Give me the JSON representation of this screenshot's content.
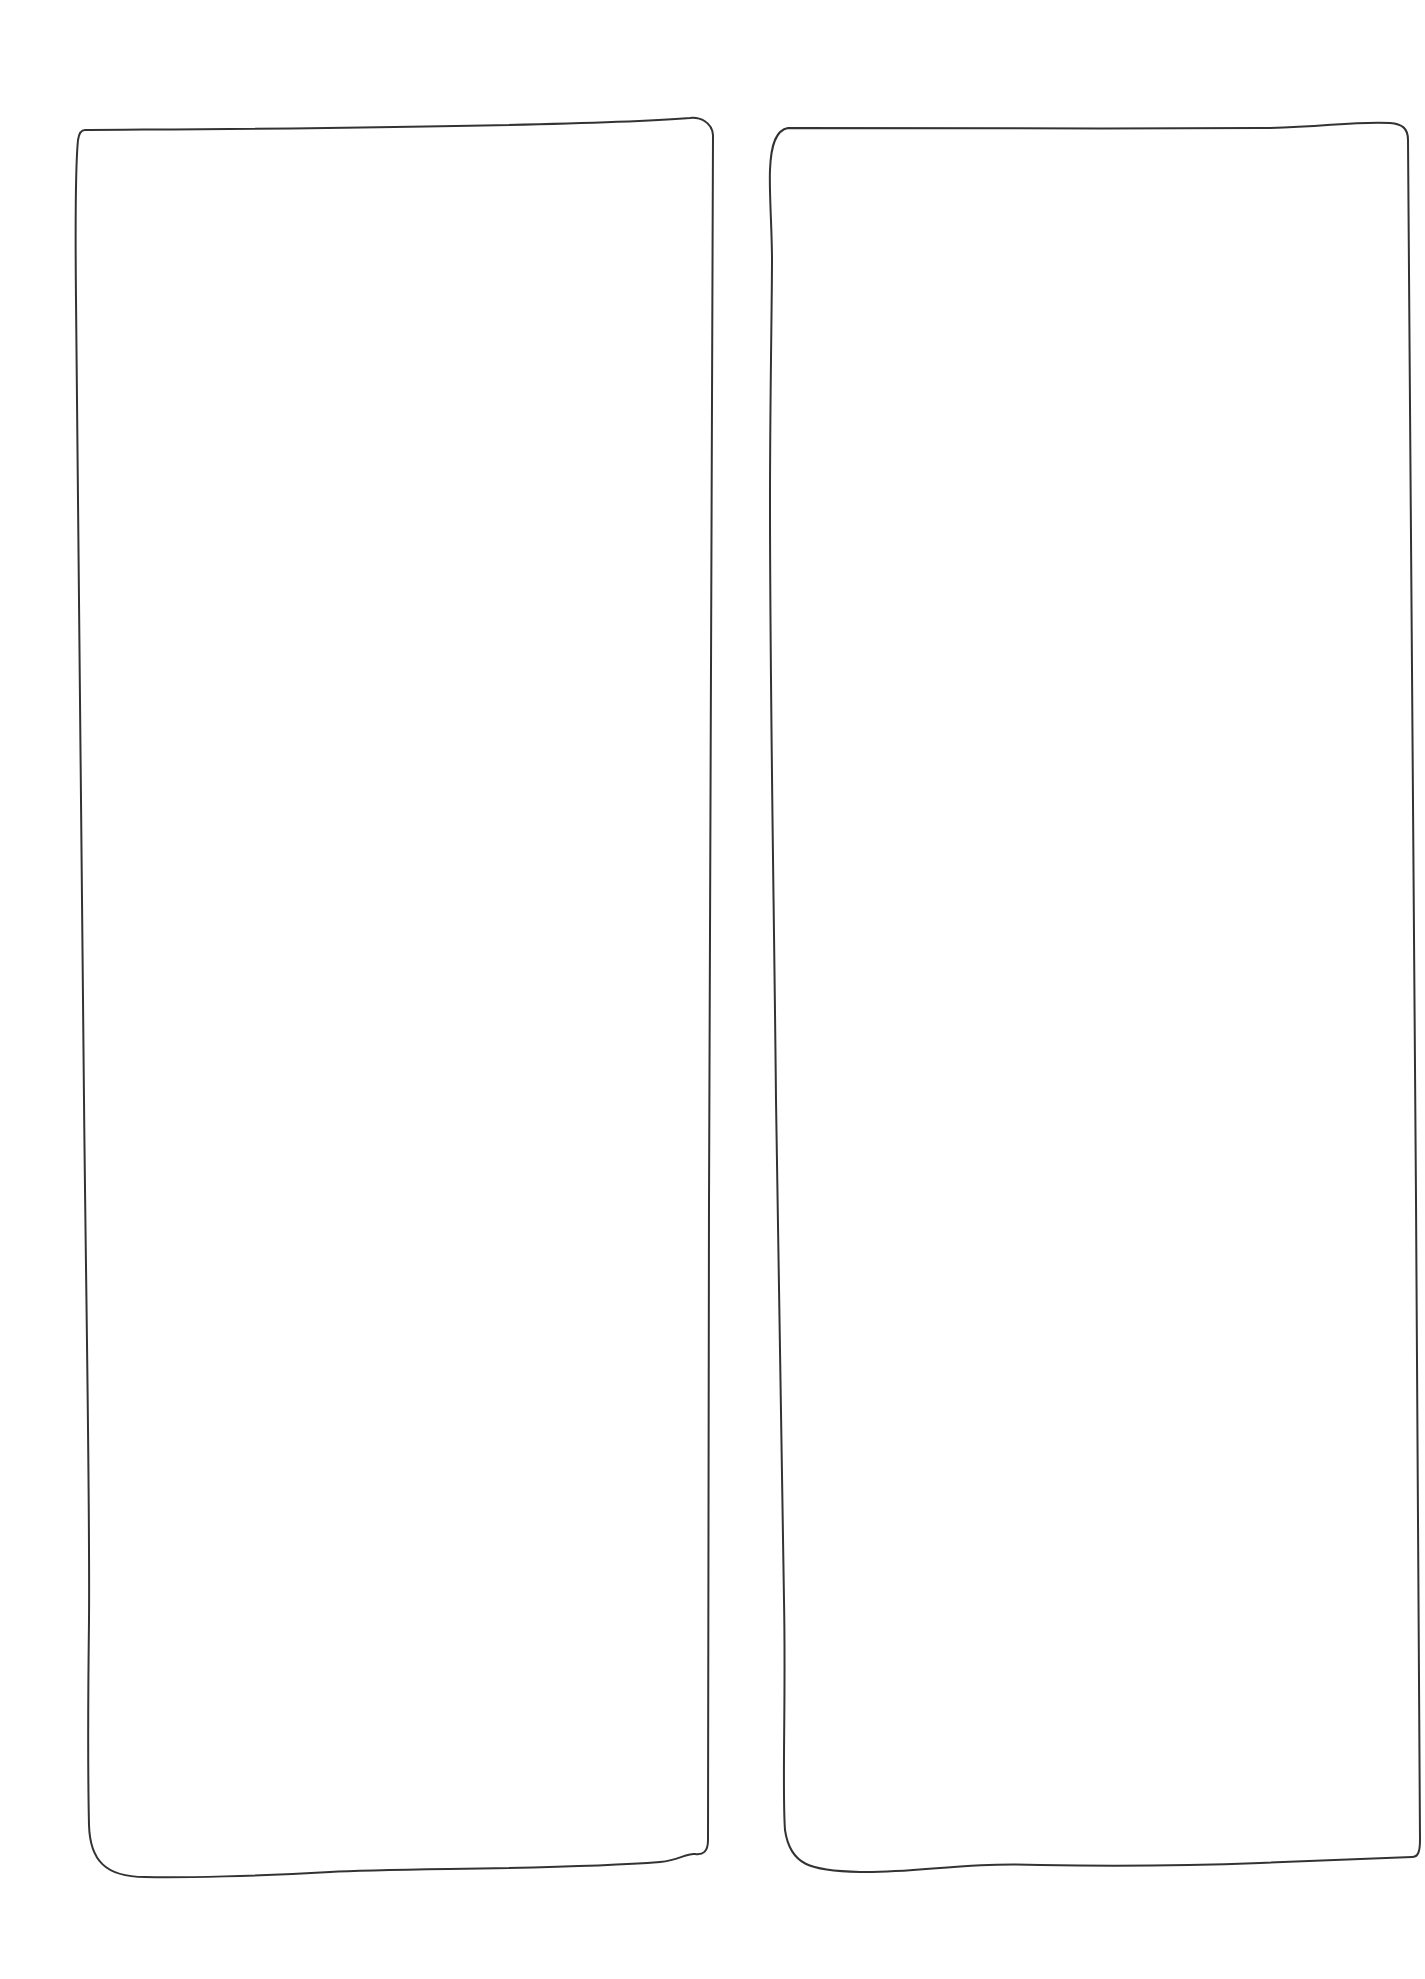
{
  "canvas": {
    "width": 1425,
    "height": 1979,
    "background": "#ffffff"
  },
  "stroke": {
    "color": "#333333",
    "width": 2
  },
  "frames": [
    {
      "name": "left-frame",
      "label": "",
      "path": "M 85 130 C 200 129 560 128 690 118 C 700 117 712 122 713 135 C 712 400 708 800 709 1200 C 709 1500 710 1800 708 1840 C 708 1852 703 1855 695 1854 C 686 1853 680 1860 660 1862 C 560 1870 400 1868 330 1872 C 260 1876 180 1878 145 1877 C 105 1877 90 1860 89 1825 C 88 1780 88 1700 89 1620 C 90 1500 86 1300 84 1100 C 81 900 78 600 76 300 C 75 200 76 160 78 140 C 79 133 81 130 85 130 Z"
    },
    {
      "name": "right-frame",
      "label": "",
      "path": "M 788 128 C 900 128 1100 129 1260 128 C 1320 128 1350 121 1390 123 C 1402 124 1408 128 1408 140 C 1408 400 1412 800 1416 1200 C 1418 1500 1420 1700 1420 1840 C 1420 1852 1418 1857 1412 1857 C 1390 1858 1340 1860 1260 1863 C 1180 1866 1100 1866 1040 1865 C 960 1862 920 1873 860 1872 C 810 1871 790 1865 785 1830 C 782 1790 786 1700 784 1600 C 780 1400 778 1200 776 1100 C 774 900 770 700 770 500 C 770 400 772 300 772 260 C 772 230 769 190 770 170 C 771 142 777 130 788 128 Z"
    }
  ]
}
